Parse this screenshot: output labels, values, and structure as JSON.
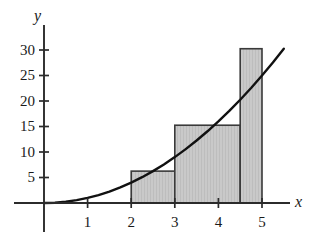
{
  "figure": {
    "axis_labels": {
      "x": "x",
      "y": "y"
    },
    "colors": {
      "axis": "#2b2b2b",
      "curve": "#111111",
      "bar_fill": "#c9c9c9",
      "bar_stroke": "#3a3a3a",
      "background": "#ffffff"
    }
  },
  "chart_data": {
    "type": "area",
    "title": "",
    "xlabel": "x",
    "ylabel": "y",
    "xlim": [
      0,
      5.6
    ],
    "ylim": [
      0,
      34
    ],
    "grid": false,
    "legend": null,
    "xticks": [
      1,
      2,
      3,
      4,
      5
    ],
    "xtick_labels": [
      "1",
      "2",
      "3",
      "4",
      "5"
    ],
    "yticks": [
      5,
      10,
      15,
      20,
      25,
      30
    ],
    "ytick_labels": [
      "5",
      "10",
      "15",
      "20",
      "25",
      "30"
    ],
    "curve": {
      "name": "y = x^2",
      "equation": "y = x^2",
      "x": [
        0,
        0.25,
        0.5,
        0.75,
        1,
        1.25,
        1.5,
        1.75,
        2,
        2.25,
        2.5,
        2.75,
        3,
        3.25,
        3.5,
        3.75,
        4,
        4.25,
        4.5,
        4.75,
        5,
        5.25,
        5.5
      ],
      "y": [
        0,
        0.06,
        0.25,
        0.56,
        1,
        1.56,
        2.25,
        3.06,
        4,
        5.06,
        6.25,
        7.56,
        9,
        10.56,
        12.25,
        14.06,
        16,
        18.06,
        20.25,
        22.56,
        25,
        27.56,
        30.25
      ]
    },
    "rectangles": {
      "method": "midpoint Riemann sum",
      "interval": [
        2,
        5
      ],
      "n": 3,
      "width": 1,
      "midpoints": [
        2.5,
        3.5,
        4.5
      ],
      "bars": [
        {
          "x_left": 2,
          "x_right": 3,
          "height": 6.25
        },
        {
          "x_left": 3,
          "x_right": 4.5,
          "height": 15.25
        },
        {
          "x_left": 4.5,
          "x_right": 5,
          "height": 30.25
        }
      ]
    }
  }
}
